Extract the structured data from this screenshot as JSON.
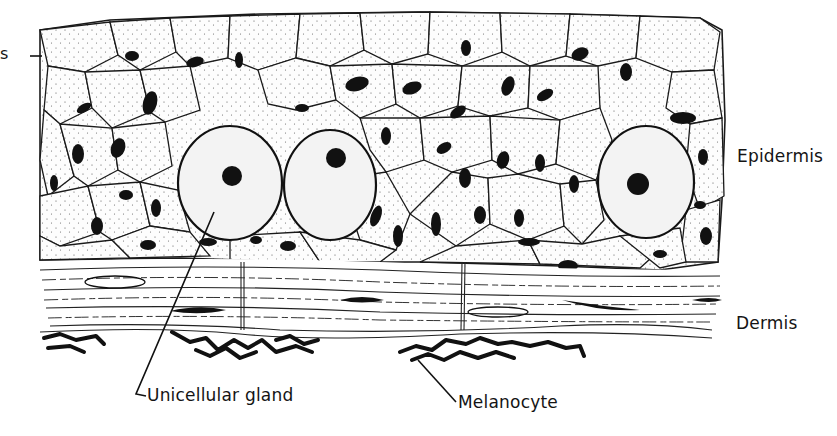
{
  "figure": {
    "layers": [
      {
        "id": "epidermis",
        "label": "Epidermis"
      },
      {
        "id": "dermis",
        "label": "Dermis"
      }
    ],
    "callouts": [
      {
        "id": "unicellular-gland",
        "label": "Unicellular gland"
      },
      {
        "id": "melanocyte",
        "label": "Melanocyte"
      }
    ],
    "edge_fragment": "s",
    "colors": {
      "ink": "#111111",
      "paper": "#ffffff",
      "stipple": "#fbfbfb"
    }
  }
}
